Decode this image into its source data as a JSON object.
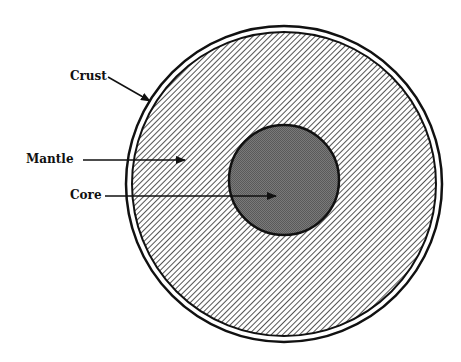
{
  "diagram": {
    "labels": {
      "crust": "Crust",
      "mantle": "Mantle",
      "core": "Core"
    },
    "colors": {
      "line": "#111111",
      "mantle_hatch": "#555555",
      "core_fill": "#6e6e6e",
      "background": "#ffffff"
    }
  }
}
